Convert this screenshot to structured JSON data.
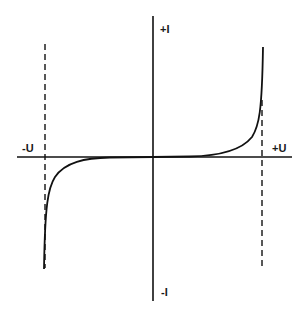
{
  "diagram": {
    "title": "",
    "type": "I-U characteristic curve",
    "axes": {
      "x_positive_label": "+U",
      "x_negative_label": "-U",
      "y_positive_label": "+I",
      "y_negative_label": "-I"
    },
    "colors": {
      "line": "#111111",
      "background": "#ffffff"
    },
    "elements": [
      {
        "id": "horizontal-axis",
        "kind": "axis",
        "label": "U"
      },
      {
        "id": "vertical-axis",
        "kind": "axis",
        "label": "I"
      },
      {
        "id": "left-breakdown-asymptote",
        "kind": "dashed-line"
      },
      {
        "id": "right-breakdown-asymptote",
        "kind": "dashed-line"
      },
      {
        "id": "characteristic-curve",
        "kind": "curve",
        "shape": "symmetric, flat near zero, steep rise at +/- breakdown voltage"
      }
    ]
  }
}
